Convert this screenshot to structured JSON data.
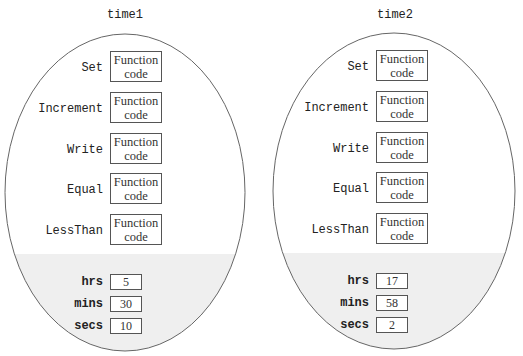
{
  "objects": [
    {
      "name": "time1",
      "functions": [
        {
          "label": "Set",
          "code": [
            "Function",
            "code"
          ]
        },
        {
          "label": "Increment",
          "code": [
            "Function",
            "code"
          ]
        },
        {
          "label": "Write",
          "code": [
            "Function",
            "code"
          ]
        },
        {
          "label": "Equal",
          "code": [
            "Function",
            "code"
          ]
        },
        {
          "label": "LessThan",
          "code": [
            "Function",
            "code"
          ]
        }
      ],
      "data": [
        {
          "label": "hrs",
          "value": "5"
        },
        {
          "label": "mins",
          "value": "30"
        },
        {
          "label": "secs",
          "value": "10"
        }
      ]
    },
    {
      "name": "time2",
      "functions": [
        {
          "label": "Set",
          "code": [
            "Function",
            "code"
          ]
        },
        {
          "label": "Increment",
          "code": [
            "Function",
            "code"
          ]
        },
        {
          "label": "Write",
          "code": [
            "Function",
            "code"
          ]
        },
        {
          "label": "Equal",
          "code": [
            "Function",
            "code"
          ]
        },
        {
          "label": "LessThan",
          "code": [
            "Function",
            "code"
          ]
        }
      ],
      "data": [
        {
          "label": "hrs",
          "value": "17"
        },
        {
          "label": "mins",
          "value": "58"
        },
        {
          "label": "secs",
          "value": "2"
        }
      ]
    }
  ],
  "colors": {
    "outline": "#666666",
    "data_region": "#efefef",
    "box_border": "#555555"
  }
}
